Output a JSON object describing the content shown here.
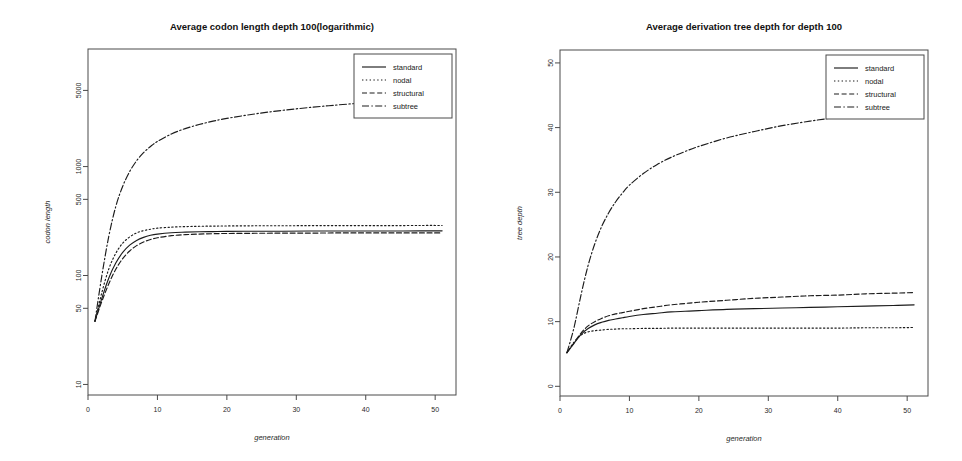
{
  "figure": {
    "background_color": "#ffffff",
    "ink_color": "#1c1c1c",
    "panel_count": 2
  },
  "chart_data": [
    {
      "id": "codon-length",
      "type": "line",
      "title": "Average codon length depth 100(logarithmic)",
      "xlabel": "generation",
      "ylabel": "codon length",
      "xlim": [
        0,
        53
      ],
      "ylim": [
        8,
        12000
      ],
      "yscale": "log",
      "xscale": "linear",
      "grid": false,
      "legend_position": "top-right",
      "xticks": [
        0,
        10,
        20,
        30,
        40,
        50
      ],
      "xtick_labels": [
        "0",
        "10",
        "20",
        "30",
        "40",
        "50"
      ],
      "yticks": [
        10,
        50,
        100,
        500,
        1000,
        5000
      ],
      "ytick_labels": [
        "10",
        "50",
        "100",
        "500",
        "1000",
        "5000"
      ],
      "x": [
        1,
        2,
        3,
        4,
        5,
        6,
        7,
        8,
        9,
        10,
        12,
        14,
        16,
        18,
        20,
        24,
        28,
        32,
        36,
        40,
        44,
        48,
        51
      ],
      "series": [
        {
          "name": "standard",
          "dash": "solid",
          "values": [
            38,
            62,
            95,
            130,
            163,
            190,
            210,
            224,
            234,
            240,
            247,
            250,
            252,
            253,
            254,
            255,
            255,
            256,
            256,
            256,
            256,
            257,
            257
          ]
        },
        {
          "name": "nodal",
          "dash": "dotted",
          "values": [
            38,
            70,
            115,
            160,
            198,
            226,
            246,
            258,
            266,
            272,
            278,
            281,
            283,
            284,
            285,
            286,
            286,
            287,
            287,
            287,
            287,
            288,
            288
          ]
        },
        {
          "name": "structural",
          "dash": "dashed",
          "values": [
            38,
            58,
            84,
            114,
            143,
            168,
            188,
            203,
            214,
            222,
            232,
            237,
            240,
            242,
            243,
            244,
            245,
            245,
            246,
            246,
            246,
            246,
            246
          ]
        },
        {
          "name": "subtree",
          "dash": "dashdot",
          "values": [
            38,
            100,
            230,
            430,
            660,
            900,
            1130,
            1340,
            1530,
            1700,
            1990,
            2230,
            2430,
            2610,
            2770,
            3040,
            3280,
            3490,
            3680,
            3860,
            4030,
            4190,
            4300
          ]
        }
      ]
    },
    {
      "id": "tree-depth",
      "type": "line",
      "title": "Average derivation tree depth for depth 100",
      "xlabel": "generation",
      "ylabel": "tree depth",
      "xlim": [
        0,
        53
      ],
      "ylim": [
        -1.5,
        52
      ],
      "yscale": "linear",
      "xscale": "linear",
      "grid": false,
      "legend_position": "top-right",
      "xticks": [
        0,
        10,
        20,
        30,
        40,
        50
      ],
      "xtick_labels": [
        "0",
        "10",
        "20",
        "30",
        "40",
        "50"
      ],
      "yticks": [
        0,
        10,
        20,
        30,
        40,
        50
      ],
      "ytick_labels": [
        "0",
        "10",
        "20",
        "30",
        "40",
        "50"
      ],
      "x": [
        1,
        2,
        3,
        4,
        5,
        6,
        7,
        8,
        9,
        10,
        12,
        14,
        16,
        18,
        20,
        24,
        28,
        32,
        36,
        40,
        44,
        48,
        51
      ],
      "series": [
        {
          "name": "standard",
          "dash": "solid",
          "values": [
            5.2,
            6.6,
            8.0,
            8.9,
            9.5,
            9.9,
            10.2,
            10.4,
            10.6,
            10.8,
            11.1,
            11.3,
            11.5,
            11.6,
            11.7,
            11.9,
            12.0,
            12.1,
            12.2,
            12.3,
            12.4,
            12.5,
            12.6
          ]
        },
        {
          "name": "nodal",
          "dash": "dotted",
          "values": [
            5.2,
            6.8,
            7.9,
            8.4,
            8.6,
            8.7,
            8.8,
            8.85,
            8.9,
            8.9,
            8.95,
            8.95,
            9.0,
            9.0,
            9.0,
            9.0,
            9.0,
            9.0,
            9.0,
            9.0,
            9.05,
            9.05,
            9.1
          ]
        },
        {
          "name": "structural",
          "dash": "dashed",
          "values": [
            5.2,
            6.7,
            8.2,
            9.3,
            10.0,
            10.5,
            10.9,
            11.2,
            11.4,
            11.6,
            12.0,
            12.3,
            12.6,
            12.8,
            13.0,
            13.3,
            13.6,
            13.8,
            14.0,
            14.1,
            14.3,
            14.4,
            14.5
          ]
        },
        {
          "name": "subtree",
          "dash": "dashdot",
          "values": [
            5.2,
            9.0,
            14.0,
            18.5,
            22.0,
            24.7,
            26.8,
            28.5,
            29.9,
            31.1,
            32.9,
            34.3,
            35.4,
            36.3,
            37.1,
            38.4,
            39.4,
            40.3,
            41.0,
            41.6,
            42.1,
            42.5,
            42.8
          ]
        }
      ]
    }
  ],
  "panels": [
    {
      "chart_index": 0,
      "legend": {
        "entries": [
          {
            "label": "standard",
            "dash": "solid"
          },
          {
            "label": "nodal",
            "dash": "dotted"
          },
          {
            "label": "structural",
            "dash": "dashed"
          },
          {
            "label": "subtree",
            "dash": "dashdot"
          }
        ]
      }
    },
    {
      "chart_index": 1,
      "legend": {
        "entries": [
          {
            "label": "standard",
            "dash": "solid"
          },
          {
            "label": "nodal",
            "dash": "dotted"
          },
          {
            "label": "structural",
            "dash": "dashed"
          },
          {
            "label": "subtree",
            "dash": "dashdot"
          }
        ]
      }
    }
  ]
}
